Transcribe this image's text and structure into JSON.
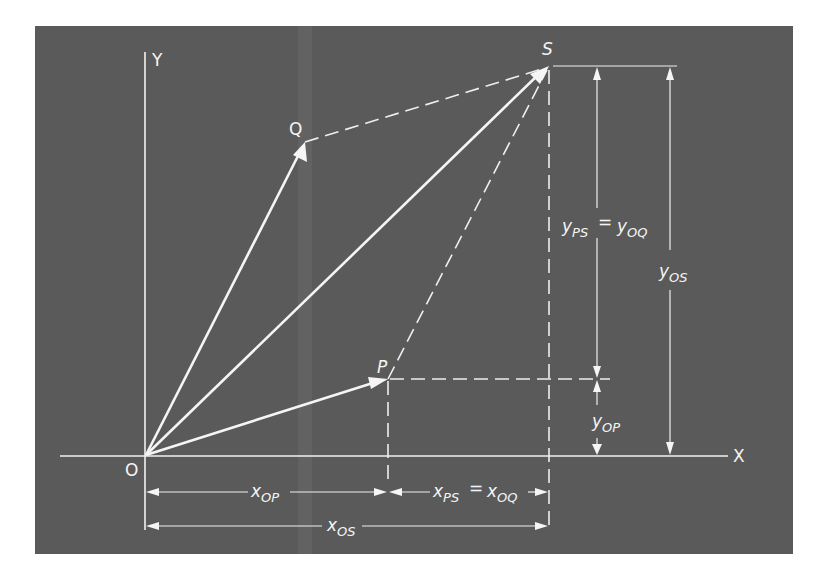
{
  "figure": {
    "type": "vector addition diagram",
    "colors": {
      "background": "#5a5a5a",
      "lines": "#f2f2f2",
      "page": "#ffffff"
    },
    "axes": {
      "x_label": "X",
      "y_label": "Y",
      "origin_label": "O"
    },
    "points": {
      "O": {
        "label": "O"
      },
      "P": {
        "label": "P"
      },
      "Q": {
        "label": "Q"
      },
      "S": {
        "label": "S"
      }
    },
    "vectors": [
      {
        "from": "O",
        "to": "Q",
        "style": "solid-arrow"
      },
      {
        "from": "O",
        "to": "S",
        "style": "solid-arrow"
      },
      {
        "from": "O",
        "to": "P",
        "style": "solid-arrow"
      },
      {
        "from": "Q",
        "to": "S",
        "style": "dashed"
      },
      {
        "from": "P",
        "to": "S",
        "style": "dashed"
      }
    ],
    "dimensions": {
      "y_ps": {
        "main": "y",
        "sub": "PS"
      },
      "equals1": "=",
      "y_oq": {
        "main": "y",
        "sub": "OQ"
      },
      "y_os": {
        "main": "y",
        "sub": "OS"
      },
      "y_op": {
        "main": "y",
        "sub": "OP"
      },
      "x_op": {
        "main": "x",
        "sub": "OP"
      },
      "x_ps": {
        "main": "x",
        "sub": "PS"
      },
      "equals2": "=",
      "x_oq": {
        "main": "x",
        "sub": "OQ"
      },
      "x_os": {
        "main": "x",
        "sub": "OS"
      }
    }
  }
}
